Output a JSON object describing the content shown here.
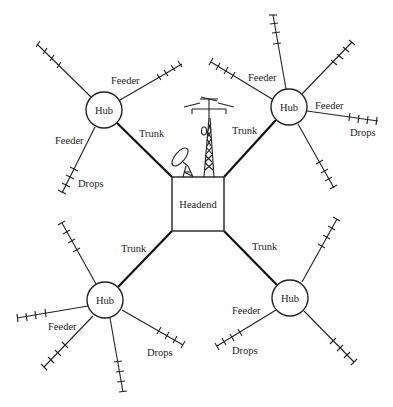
{
  "diagram": {
    "headend": {
      "label": "Headend"
    },
    "hubs": [
      {
        "id": "top-left",
        "label": "Hub"
      },
      {
        "id": "top-right",
        "label": "Hub"
      },
      {
        "id": "bottom-left",
        "label": "Hub"
      },
      {
        "id": "bottom-right",
        "label": "Hub"
      }
    ],
    "trunk_labels": [
      "Trunk",
      "Trunk",
      "Trunk",
      "Trunk"
    ],
    "feeder_labels": {
      "top_left_1": "Feeder",
      "top_left_2": "Feeder",
      "top_right_1": "Feeder",
      "top_right_2": "Feeder",
      "bottom_left": "Feeder",
      "bottom_right": "Feeder"
    },
    "drops_labels": {
      "top_left": "Drops",
      "top_right": "Drops",
      "bottom_left": "Drops",
      "bottom_right": "Drops"
    },
    "icons": [
      "satellite-dish-icon",
      "antenna-tower-icon"
    ]
  }
}
